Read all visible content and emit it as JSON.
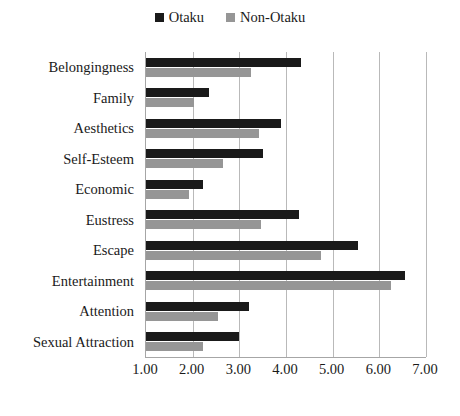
{
  "chart_data": {
    "type": "bar",
    "orientation": "horizontal",
    "title": "",
    "xlabel": "",
    "ylabel": "",
    "xlim": [
      1.0,
      7.0
    ],
    "xticks": [
      "1.00",
      "2.00",
      "3.00",
      "4.00",
      "5.00",
      "6.00",
      "7.00"
    ],
    "xtick_values": [
      1,
      2,
      3,
      4,
      5,
      6,
      7
    ],
    "grid": true,
    "legend_position": "top-center",
    "categories": [
      "Belongingness",
      "Family",
      "Aesthetics",
      "Self-Esteem",
      "Economic",
      "Eustress",
      "Escape",
      "Entertainment",
      "Attention",
      "Sexual Attraction"
    ],
    "series": [
      {
        "name": "Otaku",
        "color": "#1a1a1a",
        "values": [
          4.32,
          2.35,
          3.9,
          3.5,
          2.22,
          4.27,
          5.55,
          6.55,
          3.2,
          3.0
        ]
      },
      {
        "name": "Non-Otaku",
        "color": "#969696",
        "values": [
          3.25,
          2.03,
          3.42,
          2.65,
          1.92,
          3.47,
          4.75,
          6.25,
          2.55,
          2.22
        ]
      }
    ]
  },
  "legend": {
    "entries": [
      {
        "label": "Otaku",
        "color": "#1a1a1a",
        "swatch_icon": "square-swatch-icon"
      },
      {
        "label": "Non-Otaku",
        "color": "#969696",
        "swatch_icon": "square-swatch-icon"
      }
    ]
  },
  "colors": {
    "otaku": "#1a1a1a",
    "non_otaku": "#969696",
    "gridline": "#b9b9b9",
    "axis": "#a6a6a6",
    "background": "#ffffff",
    "text": "#1a1a1a"
  }
}
